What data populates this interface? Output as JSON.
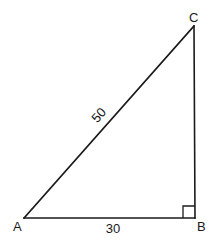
{
  "diagram": {
    "type": "right-triangle",
    "vertices": {
      "A": {
        "label": "A",
        "x": 24,
        "y": 218
      },
      "B": {
        "label": "B",
        "x": 195,
        "y": 218
      },
      "C": {
        "label": "C",
        "x": 194,
        "y": 26
      }
    },
    "sides": {
      "AC": {
        "label": "50",
        "role": "hypotenuse"
      },
      "AB": {
        "label": "30",
        "role": "base"
      },
      "BC": {
        "label": "",
        "role": "height"
      }
    },
    "right_angle_at": "B",
    "colors": {
      "stroke": "#1a1a1a",
      "background": "#ffffff"
    }
  }
}
